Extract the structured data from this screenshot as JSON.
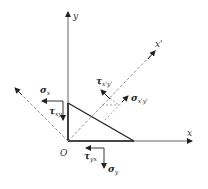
{
  "diagram": {
    "type": "stress-element-inclined-plane",
    "labels": {
      "origin": "O",
      "x_axis": "x",
      "y_axis": "y",
      "x_prime_axis": "x'",
      "sigma_x": "σ",
      "sigma_x_sub": "x",
      "tau_xy": "τ",
      "tau_xy_sub": "xy",
      "tau_yx": "τ",
      "tau_yx_sub": "yx",
      "sigma_y": "σ",
      "sigma_y_sub": "y",
      "tau_xpyp": "τ",
      "tau_xpyp_sub": "x'y'",
      "sigma_xpyp": "σ",
      "sigma_xpyp_sub": "x'y'"
    },
    "colors": {
      "line": "#333333",
      "dashed": "#777777",
      "background": "#ffffff"
    }
  }
}
